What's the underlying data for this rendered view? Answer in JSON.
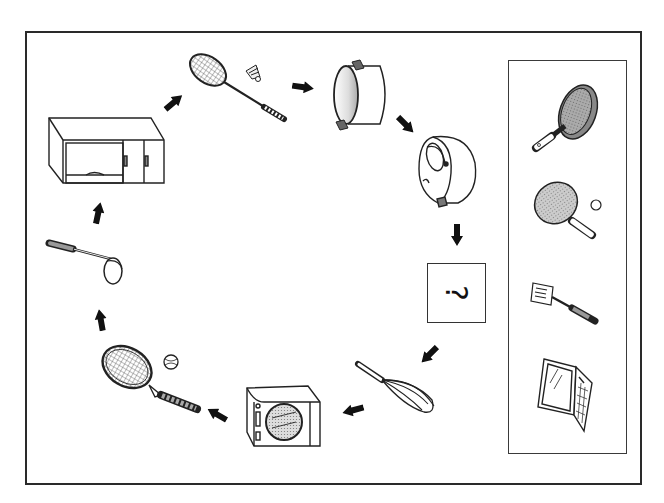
{
  "puzzle": {
    "type": "sequence-cycle",
    "question_symbol": "?",
    "question_orientation": "rotated-90",
    "cycle_items": [
      {
        "position": 1,
        "name": "badminton-racket-with-shuttlecock"
      },
      {
        "position": 2,
        "name": "cooking-pot"
      },
      {
        "position": 3,
        "name": "rice-cooker"
      },
      {
        "position": 4,
        "name": "unknown"
      },
      {
        "position": 5,
        "name": "whisk"
      },
      {
        "position": 6,
        "name": "front-loading-washing-machine"
      },
      {
        "position": 7,
        "name": "tennis-racket-with-ball"
      },
      {
        "position": 8,
        "name": "ladle"
      },
      {
        "position": 9,
        "name": "wall-cabinet"
      }
    ],
    "options": [
      {
        "index": 1,
        "name": "frying-pan"
      },
      {
        "index": 2,
        "name": "ping-pong-paddle-with-ball"
      },
      {
        "index": 3,
        "name": "spatula"
      },
      {
        "index": 4,
        "name": "laptop"
      }
    ]
  },
  "colors": {
    "line": "#222222",
    "fill_shade": "#bdbdbd",
    "frame": "#2a2a2a",
    "background": "#ffffff"
  }
}
